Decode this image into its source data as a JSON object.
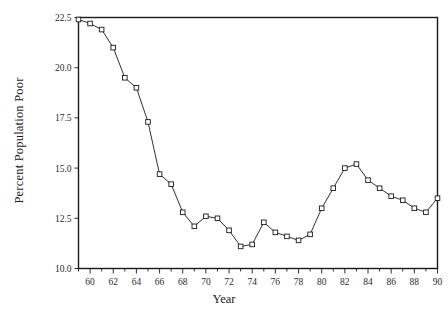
{
  "chart_data": {
    "type": "line",
    "title": "",
    "xlabel": "Year",
    "ylabel": "Percent Population Poor",
    "xlim": [
      59,
      90
    ],
    "ylim": [
      10.0,
      22.5
    ],
    "grid": false,
    "legend": null,
    "marker": "square",
    "xtick_labels": [
      "60",
      "62",
      "64",
      "66",
      "68",
      "70",
      "72",
      "74",
      "76",
      "78",
      "80",
      "82",
      "84",
      "86",
      "88",
      "90"
    ],
    "xtick_values": [
      60,
      62,
      64,
      66,
      68,
      70,
      72,
      74,
      76,
      78,
      80,
      82,
      84,
      86,
      88,
      90
    ],
    "xminor_ticks": [
      59,
      61,
      63,
      65,
      67,
      69,
      71,
      73,
      75,
      77,
      79,
      81,
      83,
      85,
      87,
      89
    ],
    "ytick_labels": [
      "10.0",
      "12.5",
      "15.0",
      "17.5",
      "20.0",
      "22.5"
    ],
    "ytick_values": [
      10.0,
      12.5,
      15.0,
      17.5,
      20.0,
      22.5
    ],
    "x": [
      59,
      60,
      61,
      62,
      63,
      64,
      65,
      66,
      67,
      68,
      69,
      70,
      71,
      72,
      73,
      74,
      75,
      76,
      77,
      78,
      79,
      80,
      81,
      82,
      83,
      84,
      85,
      86,
      87,
      88,
      89,
      90
    ],
    "values": [
      22.4,
      22.2,
      21.9,
      21.0,
      19.5,
      19.0,
      17.3,
      14.7,
      14.2,
      12.8,
      12.1,
      12.6,
      12.5,
      11.9,
      11.1,
      11.2,
      12.3,
      11.8,
      11.6,
      11.4,
      11.7,
      13.0,
      14.0,
      15.0,
      15.2,
      14.4,
      14.0,
      13.6,
      13.4,
      13.0,
      12.8,
      13.5
    ],
    "series": [
      {
        "name": "Percent Population Poor",
        "values": [
          22.4,
          22.2,
          21.9,
          21.0,
          19.5,
          19.0,
          17.3,
          14.7,
          14.2,
          12.8,
          12.1,
          12.6,
          12.5,
          11.9,
          11.1,
          11.2,
          12.3,
          11.8,
          11.6,
          11.4,
          11.7,
          13.0,
          14.0,
          15.0,
          15.2,
          14.4,
          14.0,
          13.6,
          13.4,
          13.0,
          12.8,
          13.5
        ]
      }
    ],
    "colors": {
      "line": "#1a1a1a",
      "marker_fill": "#ffffff",
      "marker_stroke": "#1a1a1a",
      "frame": "#1a1a1a",
      "background": "#ffffff"
    }
  }
}
